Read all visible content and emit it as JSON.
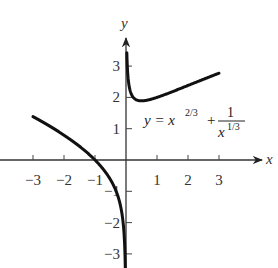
{
  "chart_data": {
    "type": "line",
    "title": "",
    "equation": {
      "lhs": "y = x",
      "exp": "2/3",
      "plus": "+",
      "num": "1",
      "den_base": "x",
      "den_exp": "1/3"
    },
    "xlabel": "x",
    "ylabel": "y",
    "xlim": [
      -3.9,
      4.5
    ],
    "ylim": [
      -3.2,
      4.3
    ],
    "xticks": [
      -3,
      -2,
      -1,
      1,
      2,
      3
    ],
    "xtick_labels": [
      "−3",
      "−2",
      "−1",
      "1",
      "2",
      "3"
    ],
    "yticks": [
      -3,
      -2,
      -1,
      1,
      2,
      3
    ],
    "ytick_labels": [
      "−3",
      "−2",
      "−1",
      "1",
      "2",
      "3"
    ],
    "grid": false,
    "legend": null,
    "series": [
      {
        "name": "y = x^(2/3) + 1/x^(1/3), x > 0",
        "x": [
          0.03,
          0.05,
          0.1,
          0.2,
          0.3,
          0.5,
          0.75,
          1,
          1.5,
          2,
          2.5,
          3
        ],
        "y": [
          3.32,
          2.85,
          2.37,
          2.05,
          1.94,
          1.89,
          1.93,
          2.0,
          2.19,
          2.38,
          2.58,
          2.77
        ]
      },
      {
        "name": "y = x^(2/3) + 1/x^(1/3), x < 0",
        "x": [
          -3,
          -2.5,
          -2,
          -1.5,
          -1,
          -0.75,
          -0.5,
          -0.3,
          -0.2,
          -0.1,
          -0.05,
          -0.03
        ],
        "y": [
          1.39,
          1.1,
          0.79,
          0.44,
          0.0,
          -0.28,
          -0.63,
          -1.05,
          -1.37,
          -1.94,
          -2.58,
          -3.11
        ]
      }
    ],
    "colors": {
      "curve": "#111111",
      "axis": "#333333"
    }
  }
}
